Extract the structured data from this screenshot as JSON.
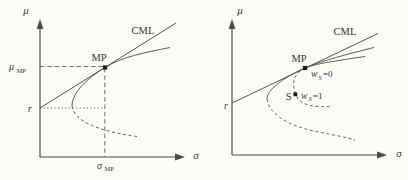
{
  "colors": {
    "line": "#4c4c4c",
    "text": "#363636",
    "background": "#fbfbf8",
    "point": "#1d1d1d"
  },
  "left_plot": {
    "y_axis_label": "μ",
    "x_axis_label": "σ",
    "cml_label": "CML",
    "mp_point_label": "MP",
    "riskfree_label": "r",
    "mu_mp_label": {
      "base": "μ",
      "sub": "MP"
    },
    "sigma_mp_label": {
      "base": "σ",
      "sub": "MP"
    }
  },
  "right_plot": {
    "y_axis_label": "μ",
    "x_axis_label": "σ",
    "cml_label": "CML",
    "mp_point_label": "MP",
    "riskfree_label": "r",
    "stock_point_label": "S",
    "weight_zero_label": {
      "base": "w",
      "sub": "S",
      "rest": "=0"
    },
    "weight_one_label": {
      "base": "w",
      "sub": "S",
      "rest": "=1"
    }
  }
}
